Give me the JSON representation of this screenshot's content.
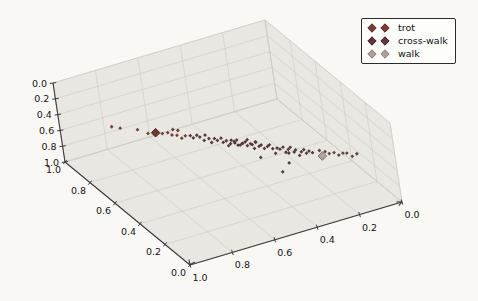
{
  "figure": {
    "background": "#faf8f5",
    "pane_color": "#e9e7e1",
    "pane_edge_color": "#d8d5cf",
    "grid_color": "#cfccc5",
    "axis_color": "#3b3b3b",
    "tick_label_color": "#141414"
  },
  "legend": {
    "position": "upper-right",
    "border_color": "#2b2b2b",
    "background": "#fdfdfb",
    "entries": [
      {
        "label": "trot",
        "fill": "#7d3b33",
        "edge": "#3f1c16"
      },
      {
        "label": "cross-walk",
        "fill": "#643340",
        "edge": "#2f1620"
      },
      {
        "label": "walk",
        "fill": "#a9a19f",
        "edge": "#9c6e6a"
      }
    ]
  },
  "chart_data": {
    "type": "scatter",
    "projection": "3d",
    "title": "",
    "xlabel": "",
    "ylabel": "",
    "zlabel": "",
    "grid": true,
    "x_range": [
      0,
      1
    ],
    "y_range": [
      0,
      1
    ],
    "z_range": [
      0,
      1
    ],
    "x_reversed": true,
    "z_reversed": true,
    "x_ticks": [
      "1.0",
      "0.8",
      "0.6",
      "0.4",
      "0.2",
      "0.0"
    ],
    "y_ticks": [
      "1.0",
      "0.8",
      "0.6",
      "0.4",
      "0.2",
      "0.0"
    ],
    "z_ticks": [
      "0.0",
      "0.2",
      "0.4",
      "0.6",
      "0.8",
      "1.0"
    ],
    "series": [
      {
        "name": "trot",
        "marker": "diamond",
        "point_color": "#6b403c",
        "marker_fill": "#74382f",
        "marker_edge": "#3f1c16",
        "highlight_point": [
          0.65,
          0.84,
          0.7
        ],
        "points": [
          [
            0.78,
            0.97,
            0.69
          ],
          [
            0.755,
            0.945,
            0.695
          ],
          [
            0.7,
            0.9,
            0.7
          ],
          [
            0.675,
            0.86,
            0.715
          ],
          [
            0.63,
            0.82,
            0.7
          ],
          [
            0.615,
            0.8,
            0.675
          ],
          [
            0.6,
            0.795,
            0.71
          ],
          [
            0.59,
            0.8,
            0.655
          ],
          [
            0.59,
            0.77,
            0.69
          ],
          [
            0.575,
            0.785,
            0.66
          ],
          [
            0.575,
            0.76,
            0.725
          ],
          [
            0.56,
            0.755,
            0.7
          ]
        ]
      },
      {
        "name": "cross-walk",
        "marker": "diamond",
        "point_color": "#53383e",
        "marker_fill": "#643340",
        "marker_edge": "#2f1620",
        "highlight_point": null,
        "points": [
          [
            0.545,
            0.74,
            0.69
          ],
          [
            0.535,
            0.735,
            0.72
          ],
          [
            0.525,
            0.72,
            0.675
          ],
          [
            0.515,
            0.715,
            0.7
          ],
          [
            0.505,
            0.7,
            0.73
          ],
          [
            0.5,
            0.695,
            0.66
          ],
          [
            0.49,
            0.685,
            0.7
          ],
          [
            0.485,
            0.675,
            0.74
          ],
          [
            0.475,
            0.665,
            0.685
          ],
          [
            0.465,
            0.66,
            0.71
          ],
          [
            0.455,
            0.645,
            0.67
          ],
          [
            0.45,
            0.64,
            0.72
          ],
          [
            0.44,
            0.63,
            0.695
          ],
          [
            0.435,
            0.625,
            0.755
          ],
          [
            0.43,
            0.615,
            0.72
          ],
          [
            0.425,
            0.615,
            0.68
          ],
          [
            0.42,
            0.6,
            0.68
          ],
          [
            0.415,
            0.605,
            0.71
          ],
          [
            0.41,
            0.595,
            0.665
          ],
          [
            0.405,
            0.6,
            0.74
          ],
          [
            0.4,
            0.59,
            0.73
          ],
          [
            0.395,
            0.58,
            0.7
          ],
          [
            0.39,
            0.585,
            0.71
          ],
          [
            0.385,
            0.57,
            0.675
          ],
          [
            0.38,
            0.565,
            0.72
          ],
          [
            0.375,
            0.57,
            0.655
          ],
          [
            0.37,
            0.555,
            0.69
          ],
          [
            0.365,
            0.55,
            0.7
          ],
          [
            0.36,
            0.545,
            0.745
          ],
          [
            0.36,
            0.5,
            0.8
          ],
          [
            0.355,
            0.54,
            0.66
          ],
          [
            0.35,
            0.545,
            0.675
          ],
          [
            0.345,
            0.53,
            0.71
          ],
          [
            0.34,
            0.52,
            0.685
          ],
          [
            0.33,
            0.515,
            0.73
          ],
          [
            0.33,
            0.38,
            0.85
          ],
          [
            0.32,
            0.505,
            0.7
          ],
          [
            0.315,
            0.495,
            0.67
          ],
          [
            0.305,
            0.49,
            0.72
          ],
          [
            0.3,
            0.48,
            0.77
          ],
          [
            0.295,
            0.47,
            0.695
          ],
          [
            0.285,
            0.465,
            0.71
          ],
          [
            0.285,
            0.4,
            0.8
          ],
          [
            0.275,
            0.455,
            0.68
          ],
          [
            0.27,
            0.445,
            0.735
          ],
          [
            0.26,
            0.44,
            0.7
          ],
          [
            0.255,
            0.43,
            0.665
          ],
          [
            0.25,
            0.46,
            0.78
          ],
          [
            0.245,
            0.42,
            0.72
          ],
          [
            0.24,
            0.415,
            0.69
          ],
          [
            0.23,
            0.405,
            0.755
          ],
          [
            0.225,
            0.395,
            0.7
          ],
          [
            0.215,
            0.39,
            0.675
          ],
          [
            0.21,
            0.38,
            0.71
          ],
          [
            0.2,
            0.375,
            0.685
          ],
          [
            0.19,
            0.365,
            0.7
          ]
        ]
      },
      {
        "name": "walk",
        "marker": "diamond",
        "point_color": "#5f4743",
        "marker_fill": "#aba4a1",
        "marker_edge": "#8f625e",
        "highlight_point": [
          0.17,
          0.32,
          0.7
        ],
        "points": [
          [
            0.16,
            0.36,
            0.69
          ],
          [
            0.145,
            0.34,
            0.69
          ],
          [
            0.13,
            0.335,
            0.72
          ],
          [
            0.115,
            0.32,
            0.7
          ],
          [
            0.1,
            0.31,
            0.73
          ],
          [
            0.085,
            0.3,
            0.705
          ],
          [
            0.07,
            0.295,
            0.71
          ],
          [
            0.05,
            0.29,
            0.76
          ],
          [
            0.035,
            0.275,
            0.72
          ]
        ]
      }
    ]
  }
}
